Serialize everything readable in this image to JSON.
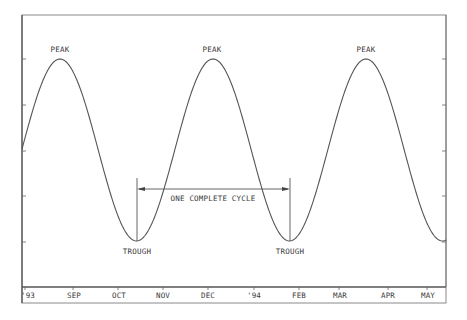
{
  "chart_data": {
    "type": "line",
    "title": "",
    "xlabel": "",
    "ylabel": "",
    "x_tick_labels": [
      "'93",
      "SEP",
      "OCT",
      "NOV",
      "DEC",
      "'94",
      "FEB",
      "MAR",
      "APR",
      "MAY"
    ],
    "y_tick_count": 5,
    "grid": false,
    "legend": null,
    "series": [
      {
        "name": "business cycle (sine wave)",
        "description": "Idealized sinusoidal cycle: starts at midline, three peaks, two troughs, ends at a trough level",
        "points_px_note": "Approximate pixel positions of key points",
        "peaks_x_month": [
          "Aug '93",
          "Dec '93",
          "Apr '94"
        ],
        "troughs_x_month": [
          "Oct '93",
          "Feb '94"
        ]
      }
    ],
    "annotations": [
      {
        "text": "PEAK",
        "target": "peak 1"
      },
      {
        "text": "PEAK",
        "target": "peak 2"
      },
      {
        "text": "PEAK",
        "target": "peak 3"
      },
      {
        "text": "TROUGH",
        "target": "trough 1"
      },
      {
        "text": "TROUGH",
        "target": "trough 2"
      },
      {
        "text": "ONE COMPLETE CYCLE",
        "target": "double-headed arrow spanning trough 1 to trough 2"
      }
    ]
  },
  "labels": {
    "peak": "PEAK",
    "trough": "TROUGH",
    "cycle": "ONE COMPLETE CYCLE"
  },
  "x_axis": {
    "ticks": [
      {
        "label": "'93",
        "x": 27
      },
      {
        "label": "SEP",
        "x": 74
      },
      {
        "label": "OCT",
        "x": 119
      },
      {
        "label": "NOV",
        "x": 163
      },
      {
        "label": "DEC",
        "x": 208
      },
      {
        "label": "'94",
        "x": 254
      },
      {
        "label": "FEB",
        "x": 299
      },
      {
        "label": "MAR",
        "x": 340
      },
      {
        "label": "APR",
        "x": 388
      },
      {
        "label": "MAY",
        "x": 428
      }
    ]
  },
  "colors": {
    "line": "#555555",
    "frame": "#555555",
    "text": "#3a3a3a"
  }
}
